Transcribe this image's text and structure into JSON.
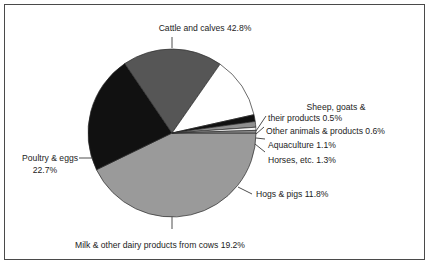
{
  "chart_data": {
    "type": "pie",
    "title": "",
    "subtitle": "",
    "xlabel": "",
    "ylabel": "",
    "legend_position": "none",
    "grid": false,
    "units": "percent",
    "total": 100.0,
    "categories": [
      "Cattle and calves",
      "Sheep, goats & their products",
      "Other animals & products",
      "Aquaculture",
      "Horses, etc.",
      "Hogs & pigs",
      "Milk & other dairy products from cows",
      "Poultry & eggs"
    ],
    "values": [
      42.8,
      0.5,
      0.6,
      1.1,
      1.3,
      11.8,
      19.2,
      22.7
    ],
    "colors": [
      "#9a9a9a",
      "#8f8f8f",
      "#f2f2f2",
      "#8f8f8f",
      "#111111",
      "#ffffff",
      "#565656",
      "#111111"
    ],
    "slices": [
      {
        "name": "Cattle and calves",
        "value": 42.8,
        "label": "Cattle and calves 42.8%",
        "color": "#9a9a9a",
        "start_angle": 0,
        "end_angle": 154.08
      },
      {
        "name": "Poultry & eggs",
        "value": 22.7,
        "label": "Poultry & eggs",
        "label2": "22.7%",
        "color": "#111111",
        "start_angle": 154.08,
        "end_angle": 235.8
      },
      {
        "name": "Milk & other dairy products from cows",
        "value": 19.2,
        "label": "Milk & other dairy products from cows 19.2%",
        "color": "#565656",
        "start_angle": 235.8,
        "end_angle": 304.92
      },
      {
        "name": "Hogs & pigs",
        "value": 11.8,
        "label": "Hogs & pigs 11.8%",
        "color": "#ffffff",
        "start_angle": 304.92,
        "end_angle": 347.4
      },
      {
        "name": "Horses, etc.",
        "value": 1.3,
        "label": "Horses, etc. 1.3%",
        "color": "#111111",
        "start_angle": 347.4,
        "end_angle": 352.08
      },
      {
        "name": "Aquaculture",
        "value": 1.1,
        "label": "Aquaculture 1.1%",
        "color": "#8f8f8f",
        "start_angle": 352.08,
        "end_angle": 356.04
      },
      {
        "name": "Other animals & products",
        "value": 0.6,
        "label": "Other animals & products 0.6%",
        "color": "#f2f2f2",
        "start_angle": 356.04,
        "end_angle": 358.2
      },
      {
        "name": "Sheep, goats & their products",
        "value": 0.5,
        "label": "Sheep, goats &",
        "label2": "their products 0.5%",
        "color": "#8f8f8f",
        "start_angle": 358.2,
        "end_angle": 360
      }
    ]
  },
  "labels": {
    "cattle": "Cattle and calves 42.8%",
    "sheep_line1": "Sheep, goats &",
    "sheep_line2": "their products 0.5%",
    "other_animals": "Other animals & products 0.6%",
    "aquaculture": "Aquaculture 1.1%",
    "horses": "Horses, etc. 1.3%",
    "hogs": "Hogs & pigs 11.8%",
    "milk": "Milk & other dairy products from cows 19.2%",
    "poultry_line1": "Poultry & eggs",
    "poultry_line2": "22.7%"
  }
}
